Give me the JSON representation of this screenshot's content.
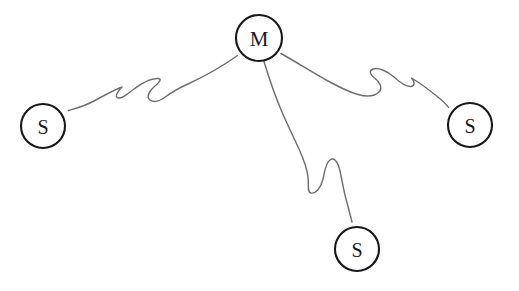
{
  "diagram": {
    "background_color": "#ffffff",
    "node_stroke_color": "#16181c",
    "node_fill_color": "#ffffff",
    "edge_color": "#6f6f70",
    "nodes": [
      {
        "id": "master",
        "label": "M",
        "role": "master",
        "cx": 259,
        "cy": 38,
        "r": 23
      },
      {
        "id": "slave-left",
        "label": "S",
        "role": "slave",
        "cx": 43,
        "cy": 126,
        "r": 22
      },
      {
        "id": "slave-right",
        "label": "S",
        "role": "slave",
        "cx": 470,
        "cy": 125,
        "r": 22
      },
      {
        "id": "slave-bottom",
        "label": "S",
        "role": "slave",
        "cx": 357,
        "cy": 249,
        "r": 22
      }
    ],
    "edges": [
      {
        "id": "edge-master-slave-left",
        "from": "master",
        "to": "slave-left",
        "style": "squiggle",
        "path": "M 237.5 55.5 C 223 66 205 76 188 84 C 178 88.5 172 92 166 96.5 C 160 101 154 103 150 100 C 146 97 149 91 155 86 C 160 81.5 162 79 158 78.5 C 152 78 142 83 134 89 C 126 95 122 99 118 98 C 114.5 97 117 92 122 87 C 114 90 103 96 94 101 C 84 106.5 75 108.5 68.5 110.5"
      },
      {
        "id": "edge-master-slave-right",
        "from": "master",
        "to": "slave-right",
        "style": "squiggle",
        "path": "M 281 53.5 C 296 62 312 72 328 81 C 339 87 349 92 358 94.5 C 367 97 375 96 379 92 C 383 88 380 82 374 77.5 C 369.5 74 369 70.5 373 69 C 378 67 387 71 394 77 C 401 83 406 87 411 86.5 C 415 86 415 82 411.5 78 C 419 82.5 428 89 436 95.5 C 443 101 447 105 448.5 107.5"
      },
      {
        "id": "edge-master-slave-bottom",
        "from": "master",
        "to": "slave-bottom",
        "style": "squiggle",
        "path": "M 264 61.5 C 269 78 275 96 282 112 C 288 126 294 138 299 149 C 303.5 159 307 168 308 177 C 309 186 307 192 311 193 C 315.5 194 321 188 323 179 C 325 170.5 325.5 163 330 160 C 334.5 157 338 162 340 171 C 342 180 343.5 190 346 199 C 348.5 208 350.5 216 352 222"
      }
    ]
  }
}
